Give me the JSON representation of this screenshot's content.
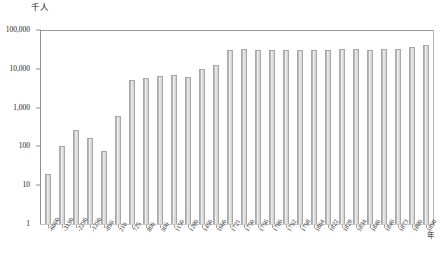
{
  "chart_data": {
    "type": "bar",
    "title": "",
    "ylabel": "千人",
    "xlabel": "年",
    "yscale": "log",
    "ylim": [
      1,
      100000
    ],
    "grid": false,
    "legend": null,
    "ytick_labels": [
      "100,000",
      "10,000",
      "1,000",
      "100",
      "10",
      "1"
    ],
    "ytick_values": [
      100000,
      10000,
      1000,
      100,
      10,
      1
    ],
    "categories": [
      "-6000",
      "-3190",
      "-2290",
      "-1290",
      "-890",
      "210",
      "725",
      "800",
      "900",
      "1150",
      "1280",
      "1450",
      "1600",
      "1721",
      "1750",
      "1756",
      "1786",
      "1792",
      "1798",
      "1804",
      "1822",
      "1828",
      "1834",
      "1840",
      "1846",
      "1873",
      "1880",
      "1890"
    ],
    "values": [
      20,
      105,
      260,
      160,
      76,
      600,
      5000,
      5800,
      6500,
      6800,
      6000,
      10000,
      12500,
      31000,
      31500,
      31000,
      30500,
      31000,
      31200,
      30800,
      31200,
      31500,
      32000,
      31000,
      32500,
      33000,
      36000,
      40000
    ]
  },
  "axis": {
    "y_unit_label": "千人",
    "x_unit_label": "年"
  }
}
